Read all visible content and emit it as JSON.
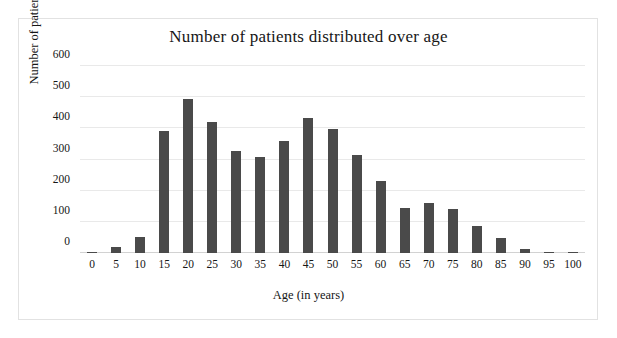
{
  "figure": {
    "title": "Number of patients distributed over age",
    "frame_color": "#e2e2e2",
    "background": "#ffffff"
  },
  "axes": {
    "xlabel": "Age (in years)",
    "ylabel_prefix": "Number of patients (",
    "ylabel_italic": "n",
    "ylabel_suffix": ")"
  },
  "chart_data": {
    "type": "bar",
    "title": "Number of patients distributed over age",
    "xlabel": "Age (in years)",
    "ylabel": "Number of patients (n)",
    "categories": [
      "0",
      "5",
      "10",
      "15",
      "20",
      "25",
      "30",
      "35",
      "40",
      "45",
      "50",
      "55",
      "60",
      "65",
      "70",
      "75",
      "80",
      "85",
      "90",
      "95",
      "100"
    ],
    "values": [
      3,
      20,
      52,
      390,
      493,
      420,
      327,
      309,
      361,
      433,
      398,
      313,
      230,
      143,
      161,
      142,
      87,
      49,
      13,
      0,
      0
    ],
    "xlim": [
      -2.5,
      102.5
    ],
    "ylim": [
      0,
      600
    ],
    "yticks": [
      0,
      100,
      200,
      300,
      400,
      500,
      600
    ],
    "ytick_labels": [
      "0",
      "100",
      "200",
      "300",
      "400",
      "500",
      "600"
    ],
    "xticks": [
      0,
      5,
      10,
      15,
      20,
      25,
      30,
      35,
      40,
      45,
      50,
      55,
      60,
      65,
      70,
      75,
      80,
      85,
      90,
      95,
      100
    ],
    "xtick_labels": [
      "0",
      "5",
      "10",
      "15",
      "20",
      "25",
      "30",
      "35",
      "40",
      "45",
      "50",
      "55",
      "60",
      "65",
      "70",
      "75",
      "80",
      "85",
      "90",
      "95",
      "100"
    ],
    "bar_color": "#4a4a4a",
    "grid": "horizontal",
    "gridline_color": "#e9e9e9",
    "legend": null,
    "legend_position": "none"
  }
}
